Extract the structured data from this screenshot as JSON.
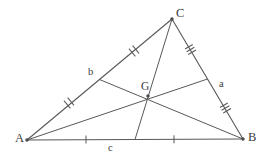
{
  "figure": {
    "canvas": {
      "width": 271,
      "height": 158
    },
    "stroke_color": "#58585a",
    "text_color": "#3b3b3d",
    "background_color": "#ffffff"
  },
  "vertices": [
    {
      "id": "A",
      "label": "A",
      "x": 27,
      "y": 140,
      "label_x": 15,
      "label_y": 132
    },
    {
      "id": "B",
      "label": "B",
      "x": 243,
      "y": 139,
      "label_x": 248,
      "label_y": 131
    },
    {
      "id": "C",
      "label": "C",
      "x": 172,
      "y": 19,
      "label_x": 176,
      "label_y": 7
    }
  ],
  "centroid": {
    "id": "G",
    "label": "G",
    "x": 148,
    "y": 96,
    "label_x": 141,
    "label_y": 81
  },
  "midpoints": [
    {
      "id": "M_AB",
      "of_side": "AB",
      "label": "c",
      "x": 135,
      "y": 139.5,
      "tick_count": 1,
      "label_x": 108,
      "label_y": 143
    },
    {
      "id": "M_BC",
      "of_side": "BC",
      "label": "a",
      "x": 207.5,
      "y": 79,
      "tick_count": 3,
      "label_x": 219,
      "label_y": 79
    },
    {
      "id": "M_AC",
      "of_side": "AC",
      "label": "b",
      "x": 99.5,
      "y": 79.5,
      "tick_count": 2,
      "label_x": 88,
      "label_y": 67
    }
  ],
  "sides": [
    {
      "id": "AB",
      "from": "A",
      "to": "B",
      "opposite_label": "c"
    },
    {
      "id": "BC",
      "from": "B",
      "to": "C",
      "opposite_label": "a"
    },
    {
      "id": "AC",
      "from": "A",
      "to": "C",
      "opposite_label": "b"
    }
  ],
  "medians": [
    {
      "id": "median-A",
      "from": "A",
      "to_midpoint": "M_BC"
    },
    {
      "id": "median-B",
      "from": "B",
      "to_midpoint": "M_AC"
    },
    {
      "id": "median-C",
      "from": "C",
      "to_midpoint": "M_AB"
    }
  ],
  "tick_groups": [
    {
      "id": "tick-A-to-MAB",
      "on_segment": "A-M_AB",
      "x": 86,
      "y": 139.5,
      "count": 1,
      "angle_deg": 0
    },
    {
      "id": "tick-MAB-to-B",
      "on_segment": "M_AB-B",
      "x": 174,
      "y": 139.3,
      "count": 1,
      "angle_deg": 0
    },
    {
      "id": "tick-A-to-MAC",
      "on_segment": "A-M_AC",
      "x": 69,
      "y": 103,
      "count": 2,
      "angle_deg": 30.5
    },
    {
      "id": "tick-MAC-to-C",
      "on_segment": "M_AC-C",
      "x": 134,
      "y": 51,
      "count": 2,
      "angle_deg": 30.5
    },
    {
      "id": "tick-C-to-MBC",
      "on_segment": "C-M_BC",
      "x": 190.5,
      "y": 49.5,
      "count": 3,
      "angle_deg": -58
    },
    {
      "id": "tick-MBC-to-B",
      "on_segment": "M_BC-B",
      "x": 225.5,
      "y": 108,
      "count": 3,
      "angle_deg": -58
    }
  ]
}
